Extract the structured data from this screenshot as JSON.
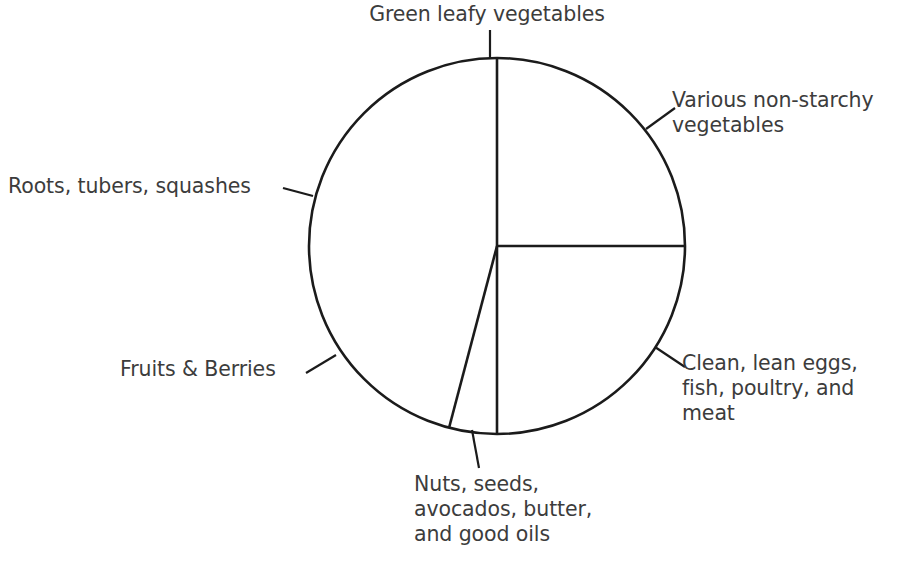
{
  "chart_data": {
    "type": "pie",
    "title": "",
    "subtitle": "",
    "xlabel": "",
    "ylabel": "",
    "legend_position": "none",
    "grid": false,
    "labels_outside": true,
    "center": {
      "x": 497,
      "y": 246
    },
    "radius": 188,
    "categories": [
      "Green leafy vegetables",
      "Various non-starchy vegetables",
      "Clean, lean eggs, fish, poultry, and meat",
      "Nuts, seeds, avocados, butter, and good oils",
      "Fruits & Berries",
      "Roots, tubers, squashes"
    ],
    "values": [
      25,
      25,
      25,
      4,
      10.5,
      10.5
    ],
    "start_angles_deg": [
      0,
      0,
      90,
      165,
      180,
      255
    ],
    "end_angles_deg": [
      0,
      90,
      165,
      180,
      255,
      360
    ],
    "slice_colors": [
      "#ffffff",
      "#ffffff",
      "#ffffff",
      "#ffffff",
      "#ffffff",
      "#ffffff"
    ],
    "outline_color": "#1b1b1b",
    "text_color": "#3c3c3c",
    "background_color": "#ffffff"
  },
  "labels": {
    "green_leafy": "Green leafy vegetables",
    "various_non_starchy": "Various non-starchy\nvegetables",
    "roots_tubers": "Roots, tubers, squashes",
    "fruits_berries": "Fruits & Berries",
    "clean_lean": "Clean, lean eggs,\nfish, poultry, and\nmeat",
    "nuts_seeds": "Nuts, seeds,\navocados, butter,\nand good oils"
  },
  "geometry": {
    "divider_top": {
      "x1": 497,
      "y1": 246,
      "x2": 497,
      "y2": 58
    },
    "divider_right": {
      "x1": 497,
      "y1": 246,
      "x2": 685,
      "y2": 246
    },
    "divider_down": {
      "x1": 497,
      "y1": 246,
      "x2": 497,
      "y2": 434
    },
    "divider_down_left": {
      "x1": 497,
      "y1": 246,
      "x2": 449,
      "y2": 428
    },
    "leader_green_leafy": {
      "x1": 490,
      "y1": 58,
      "x2": 490,
      "y2": 30
    },
    "leader_various": {
      "x1": 646,
      "y1": 129,
      "x2": 675,
      "y2": 108
    },
    "leader_roots": {
      "x1": 313,
      "y1": 196,
      "x2": 283,
      "y2": 188
    },
    "leader_fruits": {
      "x1": 336,
      "y1": 355,
      "x2": 306,
      "y2": 373
    },
    "leader_clean_lean": {
      "x1": 655,
      "y1": 347,
      "x2": 685,
      "y2": 367
    },
    "leader_nuts": {
      "x1": 472,
      "y1": 430,
      "x2": 479,
      "y2": 468
    }
  }
}
